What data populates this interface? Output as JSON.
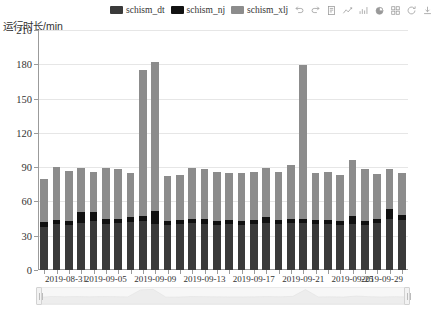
{
  "chart_data": {
    "type": "bar",
    "stacked": true,
    "title": "",
    "xlabel": "",
    "ylabel": "运行时长/min",
    "ylim": [
      0,
      210
    ],
    "ytick_step": 30,
    "yticks": [
      0,
      30,
      60,
      90,
      120,
      150,
      180,
      210
    ],
    "grid": true,
    "legend_position": "top-center",
    "categories": [
      "2019-08-31",
      "2019-09-01",
      "2019-09-02",
      "2019-09-03",
      "2019-09-04",
      "2019-09-05",
      "2019-09-06",
      "2019-09-07",
      "2019-09-08",
      "2019-09-09",
      "2019-09-10",
      "2019-09-11",
      "2019-09-12",
      "2019-09-13",
      "2019-09-14",
      "2019-09-15",
      "2019-09-16",
      "2019-09-17",
      "2019-09-18",
      "2019-09-19",
      "2019-09-20",
      "2019-09-21",
      "2019-09-22",
      "2019-09-23",
      "2019-09-24",
      "2019-09-25",
      "2019-09-26",
      "2019-09-27",
      "2019-09-28",
      "2019-09-29"
    ],
    "xtick_labels": [
      "2019-08-31",
      "2019-09-05",
      "2019-09-09",
      "2019-09-13",
      "2019-09-17",
      "2019-09-21",
      "2019-09-25",
      "2019-09-29"
    ],
    "xtick_indices": [
      0,
      5,
      9,
      13,
      17,
      21,
      25,
      29
    ],
    "series": [
      {
        "name": "schism_dt",
        "color": "#3a3a3a",
        "values": [
          38,
          40,
          39,
          41,
          43,
          40,
          41,
          42,
          43,
          40,
          39,
          40,
          41,
          40,
          39,
          40,
          39,
          40,
          41,
          40,
          41,
          41,
          40,
          40,
          39,
          40,
          39,
          41,
          45,
          44
        ]
      },
      {
        "name": "schism_nj",
        "color": "#111111",
        "values": [
          4,
          4,
          4,
          10,
          8,
          5,
          4,
          4,
          4,
          12,
          4,
          4,
          4,
          5,
          4,
          4,
          4,
          4,
          5,
          4,
          4,
          4,
          4,
          4,
          4,
          7,
          4,
          4,
          8,
          4
        ]
      },
      {
        "name": "schism_xlj",
        "color": "#8c8c8c",
        "values": [
          38,
          46,
          44,
          38,
          35,
          44,
          43,
          39,
          128,
          130,
          39,
          39,
          44,
          43,
          43,
          41,
          42,
          42,
          43,
          42,
          47,
          134,
          41,
          42,
          40,
          49,
          45,
          39,
          35,
          37
        ]
      }
    ],
    "totals": [
      80,
      90,
      87,
      89,
      86,
      89,
      88,
      85,
      175,
      182,
      82,
      83,
      89,
      88,
      86,
      85,
      85,
      86,
      89,
      86,
      92,
      179,
      85,
      86,
      83,
      96,
      88,
      84,
      88,
      85
    ]
  },
  "legend": {
    "items": [
      {
        "label": "schism_dt",
        "color": "#3a3a3a"
      },
      {
        "label": "schism_nj",
        "color": "#111111"
      },
      {
        "label": "schism_xlj",
        "color": "#8c8c8c"
      }
    ]
  },
  "toolbox": {
    "items": [
      {
        "name": "undo-icon",
        "title": "撤销"
      },
      {
        "name": "redo-icon",
        "title": "重做"
      },
      {
        "name": "data-view-icon",
        "title": "数据视图"
      },
      {
        "name": "line-chart-icon",
        "title": "切换为折线图"
      },
      {
        "name": "bar-chart-icon",
        "title": "切换为柱状图"
      },
      {
        "name": "pie-chart-icon",
        "title": "切换为饼图"
      },
      {
        "name": "tiled-chart-icon",
        "title": "平铺"
      },
      {
        "name": "restore-icon",
        "title": "还原"
      },
      {
        "name": "download-icon",
        "title": "保存为图片"
      }
    ]
  },
  "axis": {
    "y_name": "运行时长/min"
  },
  "datazoom": {
    "start_percent": 0,
    "end_percent": 100,
    "preview_values": [
      80,
      90,
      87,
      89,
      86,
      89,
      88,
      85,
      175,
      182,
      82,
      83,
      89,
      88,
      86,
      85,
      85,
      86,
      89,
      86,
      92,
      179,
      85,
      86,
      83,
      96,
      88,
      84,
      88,
      85
    ]
  }
}
